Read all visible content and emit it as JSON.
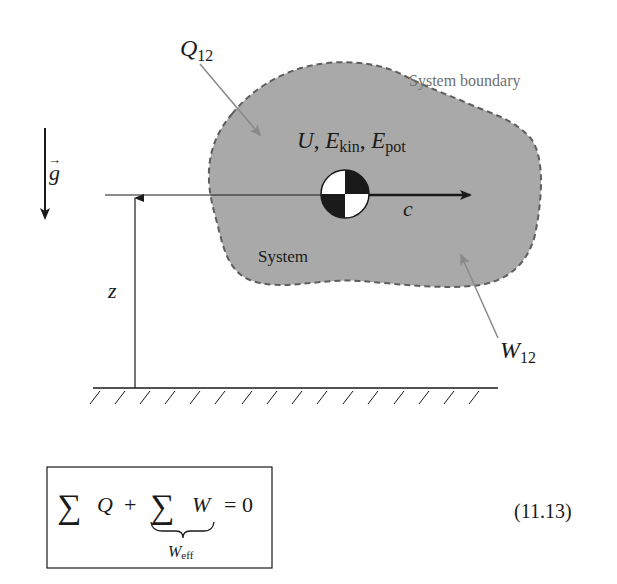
{
  "diagram": {
    "labels": {
      "heat": "Q",
      "heat_sub": "12",
      "work": "W",
      "work_sub": "12",
      "boundary": "System boundary",
      "system": "System",
      "energy_U": "U",
      "energy_sep1": ", ",
      "energy_E1": "E",
      "energy_E1_sub": "kin",
      "energy_sep2": ", ",
      "energy_E2": "E",
      "energy_E2_sub": "pot",
      "velocity": "c",
      "height": "z",
      "gravity": "g",
      "gravity_arrow": "→"
    },
    "colors": {
      "system_fill": "#a9a9a9",
      "boundary_stroke": "#5e5e5e",
      "arrow_gray": "#808080",
      "ink": "#1a1a1a"
    }
  },
  "equation": {
    "sum1": "∑",
    "q": "Q",
    "plus": "+",
    "sum2": "∑",
    "w": "W",
    "equals": "= 0",
    "underbrace_label": "W",
    "underbrace_sub": "eff",
    "number": "(11.13)"
  }
}
